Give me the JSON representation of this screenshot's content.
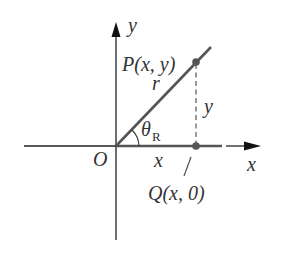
{
  "diagram": {
    "type": "coordinate-geometry",
    "axes": {
      "x_label": "x",
      "y_label": "y",
      "origin_label": "O"
    },
    "points": {
      "P": {
        "label": "P(x, y)"
      },
      "Q": {
        "label": "Q(x, 0)"
      }
    },
    "segments": {
      "radius_label": "r",
      "vertical_label": "y",
      "horizontal_label": "x"
    },
    "angle": {
      "symbol": "θ",
      "subscript": "R"
    },
    "colors": {
      "axis": "#222222",
      "ray": "#555555",
      "point": "#555555",
      "text": "#333333"
    }
  }
}
